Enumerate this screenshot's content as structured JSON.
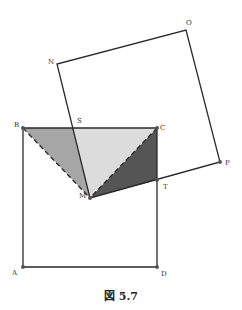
{
  "figure": {
    "caption": "図 5.7",
    "points": {
      "A": {
        "label": "A",
        "x": 23,
        "y": 267
      },
      "B": {
        "label": "B",
        "x": 23,
        "y": 128
      },
      "C": {
        "label": "C",
        "x": 157,
        "y": 128
      },
      "D": {
        "label": "D",
        "x": 157,
        "y": 267
      },
      "S": {
        "label": "S",
        "x": 73,
        "y": 128
      },
      "M": {
        "label": "M",
        "x": 90,
        "y": 198
      },
      "T": {
        "label": "T",
        "x": 157,
        "y": 180
      },
      "P": {
        "label": "P",
        "x": 220,
        "y": 162
      },
      "N": {
        "label": "N",
        "x": 57,
        "y": 64
      },
      "O": {
        "label": "O",
        "x": 186,
        "y": 30
      }
    },
    "colors": {
      "stroke": "#2a2a2a",
      "region_BSM": "#a6a6a6",
      "region_SCM": "#dcdcdc",
      "region_CMT": "#555555",
      "point": "#555555"
    }
  }
}
